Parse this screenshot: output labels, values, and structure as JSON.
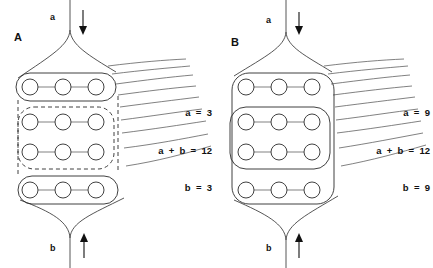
{
  "figure": {
    "title_visible": false,
    "background": "#ffffff",
    "ink_color": "#2b2b2b",
    "panels": [
      {
        "id": "A",
        "letter": "A",
        "top_label": "a",
        "top_arrow": "down-arrow-icon",
        "bottom_label": "b",
        "bottom_arrow": "up-arrow-icon",
        "rows": 4,
        "circles_per_row": 3,
        "group_style_outer": "solid",
        "group_style_middle": "dashed",
        "equations": [
          "a  =  3",
          "a  +  b  =  12",
          "b  =  3"
        ],
        "values": {
          "a": 3,
          "a_plus_b": 12,
          "b": 3
        },
        "fan_lines": 9
      },
      {
        "id": "B",
        "letter": "B",
        "top_label": "a",
        "top_arrow": "down-arrow-icon",
        "bottom_label": "b",
        "bottom_arrow": "up-arrow-icon",
        "rows": 4,
        "circles_per_row": 3,
        "group_style_outer": "solid",
        "group_style_middle": "solid",
        "equations": [
          "a  =  9",
          "a  +  b  =  12",
          "b  =  9"
        ],
        "values": {
          "a": 9,
          "a_plus_b": 12,
          "b": 9
        },
        "fan_lines": 9
      }
    ]
  }
}
